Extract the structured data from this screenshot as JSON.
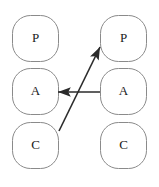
{
  "diagram": {
    "canvas": {
      "width": 159,
      "height": 187,
      "background": "#ffffff"
    },
    "style": {
      "node_stroke": "#8a8a8a",
      "node_fill": "#ffffff",
      "node_stroke_width": 1,
      "node_corner_radius": 18,
      "arrow_color": "#2b2b2b",
      "arrow_stroke_width": 1.6,
      "label_color": "#1a1a1a",
      "label_font_size": 13
    },
    "columns": [
      {
        "name": "left-column",
        "x": 12,
        "width": 47
      },
      {
        "name": "right-column",
        "x": 100,
        "width": 47
      }
    ],
    "rows": [
      {
        "name": "row-presentation",
        "y": 15,
        "height": 47
      },
      {
        "name": "row-abstraction",
        "y": 68,
        "height": 47
      },
      {
        "name": "row-control",
        "y": 122,
        "height": 47
      }
    ],
    "nodes": [
      {
        "id": "left-p",
        "label": "P",
        "column": "left",
        "row": "presentation",
        "x": 12,
        "y": 15,
        "w": 47,
        "h": 47
      },
      {
        "id": "right-p",
        "label": "P",
        "column": "right",
        "row": "presentation",
        "x": 100,
        "y": 15,
        "w": 47,
        "h": 47
      },
      {
        "id": "left-a",
        "label": "A",
        "column": "left",
        "row": "abstraction",
        "x": 12,
        "y": 68,
        "w": 47,
        "h": 47
      },
      {
        "id": "right-a",
        "label": "A",
        "column": "right",
        "row": "abstraction",
        "x": 100,
        "y": 68,
        "w": 47,
        "h": 47
      },
      {
        "id": "left-c",
        "label": "C",
        "column": "left",
        "row": "control",
        "x": 12,
        "y": 122,
        "w": 47,
        "h": 47
      },
      {
        "id": "right-c",
        "label": "C",
        "column": "right",
        "row": "control",
        "x": 100,
        "y": 122,
        "w": 47,
        "h": 47
      }
    ],
    "arrows": [
      {
        "id": "arrow-right-a-to-left-a",
        "from": "right-a",
        "to": "left-a",
        "label": "",
        "x1": 100,
        "y1": 92,
        "x2": 58,
        "y2": 92,
        "direction": "leftward-horizontal"
      },
      {
        "id": "arrow-left-c-to-right-p",
        "from": "left-c",
        "to": "right-p",
        "label": "",
        "x1": 59,
        "y1": 131,
        "x2": 100,
        "y2": 47,
        "direction": "diagonal-up-right"
      }
    ]
  }
}
